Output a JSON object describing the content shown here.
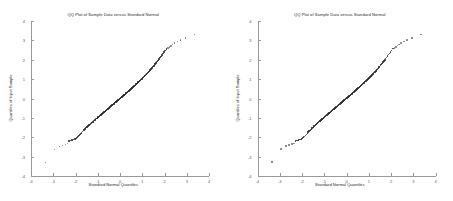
{
  "figure": {
    "panel_count": 2,
    "background": "#ffffff"
  },
  "panels": [
    {
      "id": "left-panel",
      "title": "QQ Plot of Sample Data versus Standard Normal",
      "xlabel": "Standard Normal Quantiles",
      "ylabel": "Quantiles of Input Sample",
      "xticks": [
        "-4",
        "-3",
        "-2",
        "-1",
        "0",
        "1",
        "2",
        "3",
        "4"
      ],
      "yticks": [
        "-4",
        "-3",
        "-2",
        "-1",
        "0",
        "1",
        "2",
        "3",
        "4"
      ]
    },
    {
      "id": "right-panel",
      "title": "QQ Plot of Sample Data versus Standard Normal",
      "xlabel": "Standard Normal Quantiles",
      "ylabel": "Quantiles of Input Sample",
      "xticks": [
        "-4",
        "-3",
        "-2",
        "-1",
        "0",
        "1",
        "2",
        "3",
        "4"
      ],
      "yticks": [
        "-4",
        "-3",
        "-2",
        "-1",
        "0",
        "1",
        "2",
        "3",
        "4"
      ]
    }
  ],
  "chart_data": [
    {
      "type": "scatter",
      "title": "QQ Plot of Sample Data versus Standard Normal",
      "xlabel": "Standard Normal Quantiles",
      "ylabel": "Quantiles of Input Sample",
      "xlim": [
        -4,
        4
      ],
      "ylim": [
        -4,
        4
      ],
      "xticks": [
        -4,
        -3,
        -2,
        -1,
        0,
        1,
        2,
        3,
        4
      ],
      "yticks": [
        -4,
        -3,
        -2,
        -1,
        0,
        1,
        2,
        3,
        4
      ],
      "grid": false,
      "legend": null,
      "marker_color": "#2f2f2f",
      "x": [
        -3.35,
        -2.95,
        -2.72,
        -2.58,
        -2.46,
        -2.37,
        -2.29,
        -2.22,
        -2.15,
        -2.09,
        -2.03,
        -1.98,
        -1.93,
        -1.88,
        -1.84,
        -1.8,
        -1.76,
        -1.72,
        -1.68,
        -1.65,
        -1.61,
        -1.58,
        -1.55,
        -1.52,
        -1.49,
        -1.46,
        -1.43,
        -1.4,
        -1.38,
        -1.35,
        -1.32,
        -1.3,
        -1.27,
        -1.25,
        -1.22,
        -1.2,
        -1.18,
        -1.15,
        -1.13,
        -1.11,
        -1.09,
        -1.06,
        -1.04,
        -1.02,
        -1.0,
        -0.98,
        -0.96,
        -0.94,
        -0.92,
        -0.9,
        -0.88,
        -0.86,
        -0.84,
        -0.82,
        -0.8,
        -0.78,
        -0.77,
        -0.75,
        -0.73,
        -0.71,
        -0.69,
        -0.67,
        -0.66,
        -0.64,
        -0.62,
        -0.6,
        -0.59,
        -0.57,
        -0.55,
        -0.53,
        -0.52,
        -0.5,
        -0.48,
        -0.47,
        -0.45,
        -0.43,
        -0.42,
        -0.4,
        -0.38,
        -0.37,
        -0.35,
        -0.33,
        -0.32,
        -0.3,
        -0.28,
        -0.27,
        -0.25,
        -0.24,
        -0.22,
        -0.2,
        -0.19,
        -0.17,
        -0.15,
        -0.14,
        -0.12,
        -0.11,
        -0.09,
        -0.07,
        -0.06,
        -0.04,
        -0.02,
        -0.01,
        0.01,
        0.02,
        0.04,
        0.06,
        0.07,
        0.09,
        0.11,
        0.12,
        0.14,
        0.15,
        0.17,
        0.19,
        0.2,
        0.22,
        0.24,
        0.25,
        0.27,
        0.28,
        0.3,
        0.32,
        0.33,
        0.35,
        0.37,
        0.38,
        0.4,
        0.42,
        0.43,
        0.45,
        0.47,
        0.48,
        0.5,
        0.52,
        0.53,
        0.55,
        0.57,
        0.59,
        0.6,
        0.62,
        0.64,
        0.66,
        0.67,
        0.69,
        0.71,
        0.73,
        0.75,
        0.77,
        0.78,
        0.8,
        0.82,
        0.84,
        0.86,
        0.88,
        0.9,
        0.92,
        0.94,
        0.96,
        0.98,
        1.0,
        1.02,
        1.04,
        1.06,
        1.09,
        1.11,
        1.13,
        1.15,
        1.18,
        1.2,
        1.22,
        1.25,
        1.27,
        1.3,
        1.32,
        1.35,
        1.38,
        1.4,
        1.43,
        1.46,
        1.49,
        1.52,
        1.55,
        1.58,
        1.61,
        1.65,
        1.68,
        1.72,
        1.76,
        1.8,
        1.84,
        1.88,
        1.93,
        1.98,
        2.03,
        2.09,
        2.15,
        2.22,
        2.29,
        2.37,
        2.46,
        2.58,
        2.72,
        2.95,
        3.35
      ],
      "y": [
        -3.3,
        -2.62,
        -2.48,
        -2.42,
        -2.38,
        -2.33,
        -2.2,
        -2.18,
        -2.14,
        -2.12,
        -2.1,
        -2.06,
        -2.0,
        -1.96,
        -1.92,
        -1.86,
        -1.8,
        -1.75,
        -1.7,
        -1.66,
        -1.62,
        -1.58,
        -1.54,
        -1.5,
        -1.47,
        -1.44,
        -1.41,
        -1.38,
        -1.36,
        -1.33,
        -1.3,
        -1.28,
        -1.25,
        -1.23,
        -1.2,
        -1.18,
        -1.16,
        -1.13,
        -1.11,
        -1.09,
        -1.07,
        -1.04,
        -1.02,
        -1.0,
        -0.98,
        -0.96,
        -0.94,
        -0.92,
        -0.9,
        -0.88,
        -0.86,
        -0.84,
        -0.82,
        -0.8,
        -0.78,
        -0.77,
        -0.75,
        -0.73,
        -0.71,
        -0.69,
        -0.68,
        -0.66,
        -0.64,
        -0.62,
        -0.61,
        -0.59,
        -0.57,
        -0.56,
        -0.54,
        -0.52,
        -0.51,
        -0.49,
        -0.47,
        -0.46,
        -0.44,
        -0.42,
        -0.41,
        -0.39,
        -0.37,
        -0.36,
        -0.34,
        -0.33,
        -0.31,
        -0.29,
        -0.28,
        -0.26,
        -0.25,
        -0.23,
        -0.21,
        -0.2,
        -0.18,
        -0.17,
        -0.15,
        -0.13,
        -0.12,
        -0.1,
        -0.09,
        -0.07,
        -0.05,
        -0.04,
        -0.02,
        -0.01,
        0.01,
        0.02,
        0.04,
        0.05,
        0.07,
        0.09,
        0.1,
        0.12,
        0.13,
        0.15,
        0.17,
        0.18,
        0.2,
        0.21,
        0.23,
        0.25,
        0.26,
        0.28,
        0.3,
        0.31,
        0.33,
        0.35,
        0.36,
        0.38,
        0.4,
        0.41,
        0.43,
        0.45,
        0.47,
        0.48,
        0.5,
        0.52,
        0.54,
        0.55,
        0.57,
        0.59,
        0.61,
        0.63,
        0.64,
        0.66,
        0.68,
        0.7,
        0.72,
        0.74,
        0.76,
        0.78,
        0.8,
        0.82,
        0.84,
        0.86,
        0.88,
        0.9,
        0.92,
        0.94,
        0.97,
        0.99,
        1.01,
        1.03,
        1.06,
        1.08,
        1.11,
        1.13,
        1.16,
        1.18,
        1.21,
        1.24,
        1.27,
        1.3,
        1.33,
        1.36,
        1.39,
        1.42,
        1.46,
        1.49,
        1.53,
        1.57,
        1.61,
        1.65,
        1.69,
        1.74,
        1.78,
        1.83,
        1.88,
        1.93,
        1.99,
        2.05,
        2.11,
        2.18,
        2.25,
        2.32,
        2.4,
        2.48,
        2.56,
        2.6,
        2.66,
        2.72,
        2.78,
        2.86,
        2.94,
        3.02,
        3.12,
        3.3
      ]
    },
    {
      "type": "scatter",
      "title": "QQ Plot of Sample Data versus Standard Normal",
      "xlabel": "Standard Normal Quantiles",
      "ylabel": "Quantiles of Input Sample",
      "xlim": [
        -4,
        4
      ],
      "ylim": [
        -4,
        4
      ],
      "xticks": [
        -4,
        -3,
        -2,
        -1,
        0,
        1,
        2,
        3,
        4
      ],
      "yticks": [
        -4,
        -3,
        -2,
        -1,
        0,
        1,
        2,
        3,
        4
      ],
      "grid": false,
      "legend": null,
      "marker_color": "#2f2f2f",
      "x": [
        -3.35,
        -2.95,
        -2.72,
        -2.58,
        -2.46,
        -2.37,
        -2.29,
        -2.22,
        -2.15,
        -2.09,
        -2.03,
        -1.98,
        -1.93,
        -1.88,
        -1.84,
        -1.8,
        -1.76,
        -1.72,
        -1.68,
        -1.65,
        -1.61,
        -1.58,
        -1.55,
        -1.52,
        -1.49,
        -1.46,
        -1.43,
        -1.4,
        -1.38,
        -1.35,
        -1.32,
        -1.3,
        -1.27,
        -1.25,
        -1.22,
        -1.2,
        -1.18,
        -1.15,
        -1.13,
        -1.11,
        -1.09,
        -1.06,
        -1.04,
        -1.02,
        -1.0,
        -0.98,
        -0.96,
        -0.94,
        -0.92,
        -0.9,
        -0.88,
        -0.86,
        -0.84,
        -0.82,
        -0.8,
        -0.78,
        -0.77,
        -0.75,
        -0.73,
        -0.71,
        -0.69,
        -0.67,
        -0.66,
        -0.64,
        -0.62,
        -0.6,
        -0.59,
        -0.57,
        -0.55,
        -0.53,
        -0.52,
        -0.5,
        -0.48,
        -0.47,
        -0.45,
        -0.43,
        -0.42,
        -0.4,
        -0.38,
        -0.37,
        -0.35,
        -0.33,
        -0.32,
        -0.3,
        -0.28,
        -0.27,
        -0.25,
        -0.24,
        -0.22,
        -0.2,
        -0.19,
        -0.17,
        -0.15,
        -0.14,
        -0.12,
        -0.11,
        -0.09,
        -0.07,
        -0.06,
        -0.04,
        -0.02,
        -0.01,
        0.01,
        0.02,
        0.04,
        0.06,
        0.07,
        0.09,
        0.11,
        0.12,
        0.14,
        0.15,
        0.17,
        0.19,
        0.2,
        0.22,
        0.24,
        0.25,
        0.27,
        0.28,
        0.3,
        0.32,
        0.33,
        0.35,
        0.37,
        0.38,
        0.4,
        0.42,
        0.43,
        0.45,
        0.47,
        0.48,
        0.5,
        0.52,
        0.53,
        0.55,
        0.57,
        0.59,
        0.6,
        0.62,
        0.64,
        0.66,
        0.67,
        0.69,
        0.71,
        0.73,
        0.75,
        0.77,
        0.78,
        0.8,
        0.82,
        0.84,
        0.86,
        0.88,
        0.9,
        0.92,
        0.94,
        0.96,
        0.98,
        1.0,
        1.02,
        1.04,
        1.06,
        1.09,
        1.11,
        1.13,
        1.15,
        1.18,
        1.2,
        1.22,
        1.25,
        1.27,
        1.3,
        1.32,
        1.35,
        1.38,
        1.4,
        1.43,
        1.46,
        1.49,
        1.52,
        1.55,
        1.58,
        1.61,
        1.65,
        1.68,
        1.72,
        1.76,
        1.8,
        1.84,
        1.88,
        1.93,
        1.98,
        2.03,
        2.09,
        2.15,
        2.22,
        2.29,
        2.37,
        2.46,
        2.58,
        2.72,
        2.95,
        3.35
      ],
      "y": [
        -3.28,
        -2.6,
        -2.46,
        -2.4,
        -2.36,
        -2.31,
        -2.19,
        -2.17,
        -2.13,
        -2.11,
        -2.09,
        -2.05,
        -1.99,
        -1.95,
        -1.91,
        -1.85,
        -1.79,
        -1.74,
        -1.69,
        -1.65,
        -1.61,
        -1.57,
        -1.53,
        -1.49,
        -1.46,
        -1.43,
        -1.4,
        -1.37,
        -1.35,
        -1.32,
        -1.29,
        -1.27,
        -1.24,
        -1.22,
        -1.19,
        -1.17,
        -1.15,
        -1.12,
        -1.1,
        -1.08,
        -1.06,
        -1.03,
        -1.01,
        -0.99,
        -0.97,
        -0.95,
        -0.93,
        -0.91,
        -0.89,
        -0.87,
        -0.85,
        -0.83,
        -0.81,
        -0.79,
        -0.77,
        -0.76,
        -0.74,
        -0.72,
        -0.7,
        -0.68,
        -0.67,
        -0.65,
        -0.63,
        -0.61,
        -0.6,
        -0.58,
        -0.56,
        -0.55,
        -0.53,
        -0.51,
        -0.5,
        -0.48,
        -0.46,
        -0.45,
        -0.43,
        -0.41,
        -0.4,
        -0.38,
        -0.36,
        -0.35,
        -0.33,
        -0.32,
        -0.3,
        -0.28,
        -0.27,
        -0.25,
        -0.24,
        -0.22,
        -0.2,
        -0.19,
        -0.17,
        -0.16,
        -0.14,
        -0.12,
        -0.11,
        -0.09,
        -0.08,
        -0.06,
        -0.04,
        -0.03,
        -0.01,
        0.0,
        0.02,
        0.03,
        0.05,
        0.06,
        0.08,
        0.1,
        0.11,
        0.13,
        0.14,
        0.16,
        0.18,
        0.19,
        0.21,
        0.22,
        0.24,
        0.26,
        0.27,
        0.29,
        0.31,
        0.32,
        0.34,
        0.36,
        0.37,
        0.39,
        0.41,
        0.42,
        0.44,
        0.46,
        0.48,
        0.49,
        0.51,
        0.53,
        0.55,
        0.56,
        0.58,
        0.6,
        0.62,
        0.64,
        0.65,
        0.67,
        0.69,
        0.71,
        0.73,
        0.75,
        0.77,
        0.79,
        0.81,
        0.83,
        0.85,
        0.87,
        0.89,
        0.91,
        0.93,
        0.95,
        0.98,
        1.0,
        1.02,
        1.04,
        1.07,
        1.09,
        1.12,
        1.14,
        1.17,
        1.19,
        1.22,
        1.25,
        1.28,
        1.31,
        1.34,
        1.37,
        1.4,
        1.43,
        1.47,
        1.5,
        1.54,
        1.58,
        1.62,
        1.66,
        1.7,
        1.75,
        1.79,
        1.84,
        1.89,
        1.94,
        2.0,
        2.06,
        2.12,
        2.19,
        2.26,
        2.33,
        2.41,
        2.49,
        2.57,
        2.61,
        2.67,
        2.73,
        2.79,
        2.87,
        2.95,
        3.03,
        3.13,
        3.31
      ]
    }
  ]
}
